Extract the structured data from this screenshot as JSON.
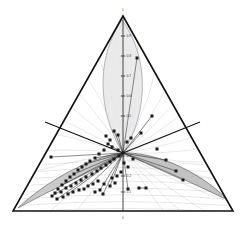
{
  "figure": {
    "type": "ternary-diagram",
    "background_color": "#ffffff",
    "width": 246,
    "height": 225
  },
  "triangle": {
    "name": "outer-triangle",
    "stroke_color": "#111111",
    "stroke_width": 1.6,
    "apex": {
      "x": 123,
      "y": 16
    },
    "left": {
      "x": 13,
      "y": 211
    },
    "right": {
      "x": 233,
      "y": 211
    }
  },
  "axis": {
    "name": "vertical-axis",
    "stroke_color": "#1a1a1a",
    "top_label": "1",
    "bottom_label": "0",
    "top_label_pos": {
      "x": 123,
      "y": 11
    },
    "bottom_label_pos": {
      "x": 123,
      "y": 219
    }
  },
  "ticks": {
    "upper": [
      {
        "label": "0.9",
        "y": 36
      },
      {
        "label": "0.8",
        "y": 56
      },
      {
        "label": "0.7",
        "y": 76
      },
      {
        "label": "0.6",
        "y": 96
      },
      {
        "label": "0.5",
        "y": 116
      }
    ],
    "lower": [
      {
        "label": "0.3",
        "y": 156
      },
      {
        "label": "0.2",
        "y": 176
      },
      {
        "label": "0.1",
        "y": 192
      }
    ]
  },
  "lenses": [
    {
      "name": "upper-lens",
      "fill": "#e6e6e6",
      "stroke": "#9a9a9a",
      "opacity": 0.85
    },
    {
      "name": "lower-left-lens",
      "fill": "#c2c2c2",
      "stroke": "#6a6a6a",
      "opacity": 0.85
    },
    {
      "name": "lower-right-lens",
      "fill": "#b8b8b8",
      "stroke": "#5e5e5e",
      "opacity": 0.85
    }
  ],
  "gridlines": {
    "name": "curved-gridlines",
    "stroke": "#bcbcbc",
    "stroke_width": 0.35,
    "count": 26
  },
  "radial_arms": [
    {
      "name": "left-arm",
      "from": {
        "x": 45,
        "y": 122
      },
      "to": {
        "x": 123,
        "y": 153
      }
    },
    {
      "name": "right-arm",
      "from": {
        "x": 200,
        "y": 122
      },
      "to": {
        "x": 123,
        "y": 153
      }
    }
  ],
  "chart_data": {
    "type": "scatter",
    "title": "",
    "xlabel": "",
    "ylabel": "",
    "marker_color": "#1a1a1a",
    "marker_shape": "square",
    "connector_color": "#2a2a2a",
    "center": {
      "x": 123,
      "y": 153
    },
    "points": [
      {
        "x": 123,
        "y": 153
      },
      {
        "x": 118,
        "y": 150
      },
      {
        "x": 112,
        "y": 147
      },
      {
        "x": 108,
        "y": 144
      },
      {
        "x": 104,
        "y": 150
      },
      {
        "x": 99,
        "y": 154
      },
      {
        "x": 95,
        "y": 158
      },
      {
        "x": 90,
        "y": 161
      },
      {
        "x": 86,
        "y": 164
      },
      {
        "x": 82,
        "y": 167
      },
      {
        "x": 78,
        "y": 170
      },
      {
        "x": 74,
        "y": 174
      },
      {
        "x": 70,
        "y": 177
      },
      {
        "x": 66,
        "y": 181
      },
      {
        "x": 62,
        "y": 185
      },
      {
        "x": 58,
        "y": 189
      },
      {
        "x": 55,
        "y": 193
      },
      {
        "x": 52,
        "y": 196
      },
      {
        "x": 61,
        "y": 192
      },
      {
        "x": 66,
        "y": 188
      },
      {
        "x": 71,
        "y": 186
      },
      {
        "x": 76,
        "y": 183
      },
      {
        "x": 81,
        "y": 180
      },
      {
        "x": 86,
        "y": 177
      },
      {
        "x": 92,
        "y": 174
      },
      {
        "x": 97,
        "y": 171
      },
      {
        "x": 101,
        "y": 168
      },
      {
        "x": 106,
        "y": 165
      },
      {
        "x": 110,
        "y": 162
      },
      {
        "x": 114,
        "y": 159
      },
      {
        "x": 119,
        "y": 156
      },
      {
        "x": 88,
        "y": 186
      },
      {
        "x": 93,
        "y": 184
      },
      {
        "x": 98,
        "y": 181
      },
      {
        "x": 79,
        "y": 190
      },
      {
        "x": 84,
        "y": 189
      },
      {
        "x": 68,
        "y": 194
      },
      {
        "x": 73,
        "y": 192
      },
      {
        "x": 57,
        "y": 199
      },
      {
        "x": 63,
        "y": 197
      },
      {
        "x": 104,
        "y": 184
      },
      {
        "x": 110,
        "y": 186
      },
      {
        "x": 115,
        "y": 183
      },
      {
        "x": 100,
        "y": 190
      },
      {
        "x": 95,
        "y": 192
      },
      {
        "x": 127,
        "y": 142
      },
      {
        "x": 131,
        "y": 138
      },
      {
        "x": 118,
        "y": 135
      },
      {
        "x": 114,
        "y": 131
      },
      {
        "x": 110,
        "y": 140
      },
      {
        "x": 106,
        "y": 136
      },
      {
        "x": 141,
        "y": 133
      },
      {
        "x": 152,
        "y": 116
      },
      {
        "x": 137,
        "y": 58
      },
      {
        "x": 157,
        "y": 149
      },
      {
        "x": 176,
        "y": 171
      },
      {
        "x": 183,
        "y": 180
      },
      {
        "x": 166,
        "y": 160
      },
      {
        "x": 51,
        "y": 157
      },
      {
        "x": 139,
        "y": 188
      },
      {
        "x": 146,
        "y": 188
      },
      {
        "x": 128,
        "y": 189
      },
      {
        "x": 103,
        "y": 194
      },
      {
        "x": 124,
        "y": 163
      },
      {
        "x": 128,
        "y": 167
      },
      {
        "x": 121,
        "y": 172
      },
      {
        "x": 117,
        "y": 176
      },
      {
        "x": 112,
        "y": 178
      },
      {
        "x": 133,
        "y": 159
      }
    ],
    "connectors": [
      [
        [
          51,
          157
        ],
        [
          123,
          153
        ]
      ],
      [
        [
          152,
          116
        ],
        [
          123,
          153
        ]
      ],
      [
        [
          137,
          58
        ],
        [
          123,
          153
        ]
      ],
      [
        [
          183,
          180
        ],
        [
          123,
          153
        ]
      ],
      [
        [
          176,
          171
        ],
        [
          123,
          153
        ]
      ],
      [
        [
          166,
          160
        ],
        [
          123,
          153
        ]
      ],
      [
        [
          141,
          133
        ],
        [
          123,
          153
        ]
      ],
      [
        [
          52,
          196
        ],
        [
          123,
          153
        ]
      ],
      [
        [
          103,
          194
        ],
        [
          123,
          153
        ]
      ],
      [
        [
          128,
          189
        ],
        [
          123,
          153
        ]
      ],
      [
        [
          139,
          188
        ],
        [
          146,
          188
        ]
      ],
      [
        [
          114,
          131
        ],
        [
          123,
          153
        ]
      ],
      [
        [
          118,
          135
        ],
        [
          123,
          153
        ]
      ],
      [
        [
          108,
          144
        ],
        [
          123,
          153
        ]
      ],
      [
        [
          95,
          158
        ],
        [
          123,
          153
        ]
      ],
      [
        [
          86,
          164
        ],
        [
          123,
          153
        ]
      ],
      [
        [
          74,
          174
        ],
        [
          123,
          153
        ]
      ],
      [
        [
          62,
          185
        ],
        [
          123,
          153
        ]
      ],
      [
        [
          88,
          186
        ],
        [
          123,
          153
        ]
      ],
      [
        [
          100,
          190
        ],
        [
          123,
          153
        ]
      ],
      [
        [
          110,
          186
        ],
        [
          123,
          153
        ]
      ],
      [
        [
          57,
          199
        ],
        [
          123,
          153
        ]
      ],
      [
        [
          68,
          194
        ],
        [
          123,
          153
        ]
      ]
    ]
  }
}
